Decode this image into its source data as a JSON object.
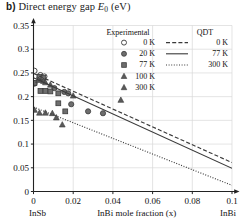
{
  "panel_label": "b)",
  "title": "Direct energy gap",
  "title_symbol": "E",
  "title_symbol_sub": "0",
  "title_units": "(eV)",
  "axes": {
    "x_label": "InBi mole fraction (x)",
    "x_left_end_label": "InSb",
    "x_right_end_label": "InBi",
    "y_ticks": [
      "0",
      "0.05",
      "0.1",
      "0.15",
      "0.2",
      "0.25",
      "0.3",
      "0.35"
    ],
    "x_ticks": [
      "0",
      "0.02",
      "0.04",
      "0.06",
      "0.08",
      "0.1"
    ]
  },
  "legend": {
    "col1_header": "Experimental",
    "col2_header": "QDT",
    "experimental": [
      {
        "label": "0 K",
        "marker": "open-circle"
      },
      {
        "label": "20 K",
        "marker": "filled-circle"
      },
      {
        "label": "77 K",
        "marker": "square"
      },
      {
        "label": "100 K",
        "marker": "triangle"
      },
      {
        "label": "300 K",
        "marker": "triangle"
      }
    ],
    "qdt": [
      {
        "label": "0 K",
        "style": "dashed"
      },
      {
        "label": "77 K",
        "style": "solid"
      },
      {
        "label": "300 K",
        "style": "dotted"
      }
    ]
  },
  "chart_data": {
    "type": "scatter",
    "title": "b) Direct energy gap E0 (eV)",
    "xlabel": "InBi mole fraction (x)",
    "ylabel": "Direct energy gap E0 (eV)",
    "xlim": [
      0,
      0.1
    ],
    "ylim": [
      0,
      0.35
    ],
    "xticks": [
      0,
      0.02,
      0.04,
      0.06,
      0.08,
      0.1
    ],
    "yticks": [
      0,
      0.05,
      0.1,
      0.15,
      0.2,
      0.25,
      0.3,
      0.35
    ],
    "grid": true,
    "legend_position": "top-right",
    "series": [
      {
        "name": "Experimental 0 K",
        "kind": "scatter",
        "marker": "open-circle",
        "points": [
          [
            0.0005,
            0.2545
          ],
          [
            0.0035,
            0.2455
          ],
          [
            0.0055,
            0.2425
          ]
        ]
      },
      {
        "name": "Experimental 20 K",
        "kind": "scatter",
        "marker": "filled-circle",
        "points": [
          [
            0.0005,
            0.2275
          ],
          [
            0.003,
            0.24
          ],
          [
            0.0045,
            0.238
          ],
          [
            0.0105,
            0.218
          ],
          [
            0.0155,
            0.21
          ],
          [
            0.0175,
            0.207
          ],
          [
            0.019,
            0.184
          ],
          [
            0.0275,
            0.169
          ],
          [
            0.035,
            0.165
          ]
        ]
      },
      {
        "name": "Experimental 77 K",
        "kind": "scatter",
        "marker": "square",
        "points": [
          [
            0.0005,
            0.229
          ],
          [
            0.003,
            0.242
          ],
          [
            0.005,
            0.24
          ],
          [
            0.0035,
            0.212
          ],
          [
            0.006,
            0.212
          ],
          [
            0.0085,
            0.211
          ],
          [
            0.0125,
            0.207
          ],
          [
            0.0125,
            0.186
          ],
          [
            0.016,
            0.169
          ]
        ]
      },
      {
        "name": "Experimental 100 K",
        "kind": "scatter",
        "marker": "triangle",
        "points": [
          [
            0.0025,
            0.235
          ],
          [
            0.005,
            0.233
          ],
          [
            0.006,
            0.23
          ],
          [
            0.0085,
            0.225
          ],
          [
            0.02,
            0.202
          ],
          [
            0.044,
            0.193
          ]
        ]
      },
      {
        "name": "Experimental 300 K",
        "kind": "scatter",
        "marker": "triangle",
        "points": [
          [
            0.0005,
            0.172
          ],
          [
            0.003,
            0.166
          ],
          [
            0.006,
            0.166
          ],
          [
            0.0095,
            0.165
          ],
          [
            0.0115,
            0.156
          ],
          [
            0.0145,
            0.141
          ]
        ]
      },
      {
        "name": "QDT 0 K",
        "kind": "line",
        "style": "dashed",
        "points": [
          [
            0.0,
            0.249
          ],
          [
            0.1,
            0.061
          ]
        ]
      },
      {
        "name": "QDT 77 K",
        "kind": "line",
        "style": "solid",
        "points": [
          [
            0.0,
            0.24
          ],
          [
            0.1,
            0.049
          ]
        ]
      },
      {
        "name": "QDT 300 K",
        "kind": "line",
        "style": "dotted",
        "points": [
          [
            0.0,
            0.178
          ],
          [
            0.1,
            0.013
          ]
        ]
      }
    ]
  }
}
